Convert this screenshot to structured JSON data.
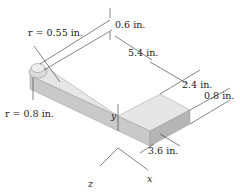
{
  "figure": {
    "type": "isometric dimensioned drawing of L-shaped plate",
    "labels": {
      "r_small": "r = 0.55 in.",
      "r_large": "r = 0.8 in.",
      "dim_thickness_top": "0.6 in.",
      "dim_length_long": "5.4 in.",
      "dim_length_short": "2.4 in.",
      "dim_height": "0.8 in.",
      "dim_width": "3.6 in."
    },
    "axes": {
      "x": "x",
      "y": "y",
      "z": "z"
    },
    "colors": {
      "top_face": "#e6e6e6",
      "side_face": "#c9c9c9",
      "front_face": "#b5b5b5",
      "line": "#333333"
    }
  }
}
